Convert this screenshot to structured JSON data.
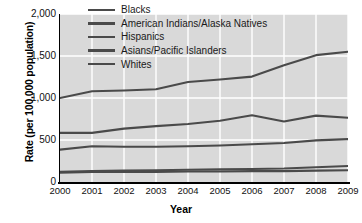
{
  "chart_data": {
    "type": "line",
    "title": "",
    "xlabel": "Year",
    "ylabel": "Rate (per 100,000 population)",
    "categories": [
      "2000",
      "2001",
      "2002",
      "2003",
      "2004",
      "2005",
      "2006",
      "2007",
      "2008",
      "2009"
    ],
    "x": [
      2000,
      2001,
      2002,
      2003,
      2004,
      2005,
      2006,
      2007,
      2008,
      2009
    ],
    "ylim": [
      0,
      2000
    ],
    "xlim": [
      2000,
      2009
    ],
    "yticks": [
      "0",
      "500",
      "1,000",
      "1,500",
      "2,000"
    ],
    "ytick_values": [
      0,
      500,
      1000,
      1500,
      2000
    ],
    "grid": true,
    "legend_position": "top-center",
    "plot_background": "#d9d9d9",
    "gridline_color": "#ffffff",
    "line_color": "#4a4a4a",
    "series": [
      {
        "name": "Blacks",
        "color": "#4a4a4a",
        "values": [
          1000,
          1080,
          1090,
          1105,
          1190,
          1220,
          1255,
          1390,
          1510,
          1550
        ]
      },
      {
        "name": "American Indians/Alaska Natives",
        "color": "#4a4a4a",
        "values": [
          585,
          585,
          635,
          665,
          690,
          730,
          795,
          720,
          790,
          765
        ]
      },
      {
        "name": "Hispanics",
        "color": "#4a4a4a",
        "values": [
          385,
          425,
          420,
          420,
          425,
          435,
          450,
          465,
          495,
          510
        ]
      },
      {
        "name": "Asians/Pacific Islanders",
        "color": "#4a4a4a",
        "values": [
          110,
          120,
          120,
          120,
          125,
          125,
          130,
          130,
          135,
          140
        ]
      },
      {
        "name": "Whites",
        "color": "#4a4a4a",
        "values": [
          120,
          130,
          135,
          140,
          145,
          150,
          155,
          160,
          175,
          190
        ]
      }
    ]
  },
  "legend": {
    "items": [
      {
        "label": "Blacks"
      },
      {
        "label": "American Indians/Alaska Natives"
      },
      {
        "label": "Hispanics"
      },
      {
        "label": "Asians/Pacific Islanders"
      },
      {
        "label": "Whites"
      }
    ]
  },
  "axes": {
    "y_title": "Rate (per 100,000 population)",
    "x_title": "Year"
  }
}
